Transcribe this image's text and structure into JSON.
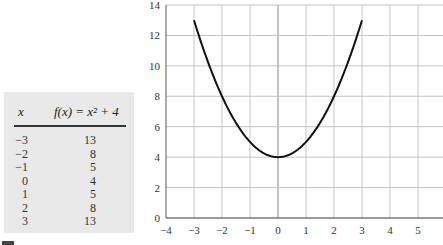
{
  "table": {
    "header_x": "x",
    "header_fx": "f(x) = x² + 4",
    "rows": [
      {
        "x": "−3",
        "y": "13"
      },
      {
        "x": "−2",
        "y": "8"
      },
      {
        "x": "−1",
        "y": "5"
      },
      {
        "x": "0",
        "y": "4"
      },
      {
        "x": "1",
        "y": "5"
      },
      {
        "x": "2",
        "y": "8"
      },
      {
        "x": "3",
        "y": "13"
      }
    ]
  },
  "chart_data": {
    "type": "line",
    "title": "",
    "xlabel": "",
    "ylabel": "",
    "xlim": [
      -4,
      6
    ],
    "ylim": [
      0,
      14
    ],
    "grid": true,
    "x_ticks": [
      -4,
      -3,
      -2,
      -1,
      0,
      1,
      2,
      3,
      4,
      5
    ],
    "x_tick_labels": [
      "−4",
      "−3",
      "−2",
      "−1",
      "0",
      "1",
      "2",
      "3",
      "4",
      "5"
    ],
    "y_ticks": [
      0,
      2,
      4,
      6,
      8,
      10,
      12,
      14
    ],
    "y_tick_labels": [
      "0",
      "2",
      "4",
      "6",
      "8",
      "10",
      "12",
      "14"
    ],
    "series": [
      {
        "name": "f(x) = x² + 4",
        "function": "x^2 + 4",
        "domain": [
          -3,
          3
        ],
        "x": [
          -3,
          -2,
          -1,
          0,
          1,
          2,
          3
        ],
        "y": [
          13,
          8,
          5,
          4,
          5,
          8,
          13
        ],
        "color": "#111111"
      }
    ]
  }
}
